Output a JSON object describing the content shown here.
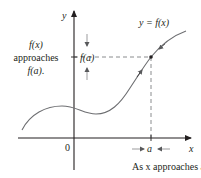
{
  "figure": {
    "type": "limit-illustration",
    "curve_label": "y = f(x)",
    "axis_labels": {
      "x": "x",
      "y": "y"
    },
    "origin_label": "0",
    "point_labels": {
      "x_value": "a",
      "y_value": "f(a)"
    },
    "left_note": [
      "f(x)",
      "approaches",
      "f(a)."
    ],
    "bottom_note": "As x approaches a,",
    "colors": {
      "ink": "#231f20",
      "curve": "#6d6e71",
      "dashed": "#6d6e71"
    }
  }
}
